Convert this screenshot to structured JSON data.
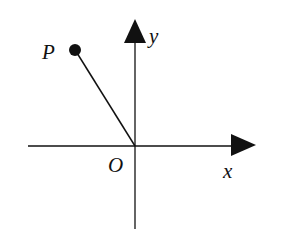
{
  "diagram": {
    "type": "coordinate-plane",
    "labels": {
      "point": "P",
      "origin": "O",
      "x_axis": "x",
      "y_axis": "y"
    },
    "colors": {
      "ink": "#111111",
      "background": "#ffffff"
    },
    "elements": [
      {
        "kind": "axis",
        "name": "x-axis",
        "direction": "horizontal"
      },
      {
        "kind": "axis",
        "name": "y-axis",
        "direction": "vertical"
      },
      {
        "kind": "point",
        "name": "P",
        "quadrant": "II"
      },
      {
        "kind": "segment",
        "from": "O",
        "to": "P"
      }
    ]
  }
}
